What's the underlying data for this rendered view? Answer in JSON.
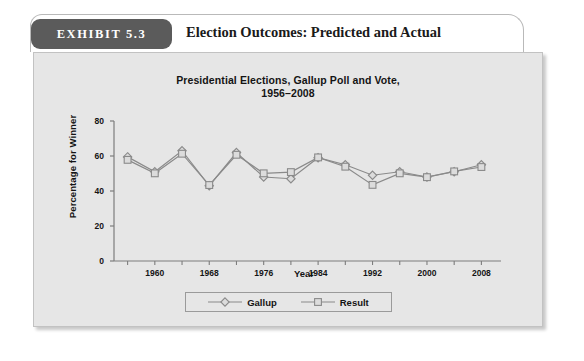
{
  "exhibit": {
    "number_label": "EXHIBIT 5.3",
    "title": "Election Outcomes: Predicted and Actual"
  },
  "chart_data": {
    "type": "line",
    "title": "Presidential Elections, Gallup Poll and Vote,\n1956–2008",
    "title_line1": "Presidential Elections, Gallup Poll and Vote,",
    "title_line2": "1956–2008",
    "xlabel": "Year",
    "ylabel": "Percentage for Winner",
    "xlim": [
      1954,
      2010
    ],
    "ylim": [
      0,
      80
    ],
    "ytick_values": [
      0,
      20,
      40,
      60,
      80
    ],
    "ytick_labels": [
      "0",
      "20",
      "40",
      "60",
      "80"
    ],
    "xtick_values": [
      1960,
      1968,
      1976,
      1984,
      1992,
      2000,
      2008
    ],
    "xtick_labels": [
      "1960",
      "1968",
      "1976",
      "1984",
      "1992",
      "2000",
      "2008"
    ],
    "minor_xticks": [
      1956,
      1960,
      1964,
      1968,
      1972,
      1976,
      1980,
      1984,
      1988,
      1992,
      1996,
      2000,
      2004,
      2008
    ],
    "grid": false,
    "legend_position": "bottom-center",
    "x": [
      1956,
      1960,
      1964,
      1968,
      1972,
      1976,
      1980,
      1984,
      1988,
      1992,
      1996,
      2000,
      2004,
      2008
    ],
    "series": [
      {
        "name": "Gallup",
        "marker": "diamond",
        "color": "#8a8a8a",
        "values": [
          59.5,
          51.0,
          63.0,
          43.0,
          62.0,
          48.0,
          47.0,
          59.0,
          55.0,
          49.0,
          51.0,
          48.0,
          51.0,
          55.0
        ]
      },
      {
        "name": "Result",
        "marker": "square",
        "color": "#8a8a8a",
        "values": [
          57.8,
          50.1,
          61.3,
          43.4,
          60.7,
          50.1,
          50.8,
          59.2,
          53.9,
          43.5,
          50.1,
          47.9,
          51.2,
          53.7
        ]
      }
    ]
  },
  "legend": {
    "entries": [
      {
        "label": "Gallup",
        "marker": "diamond"
      },
      {
        "label": "Result",
        "marker": "square"
      }
    ]
  },
  "colors": {
    "panel_background": "#e6e6e6",
    "badge_background": "#5b5b5b",
    "axis": "#7d7d7d",
    "series_line": "#8a8a8a",
    "text": "#141414"
  }
}
